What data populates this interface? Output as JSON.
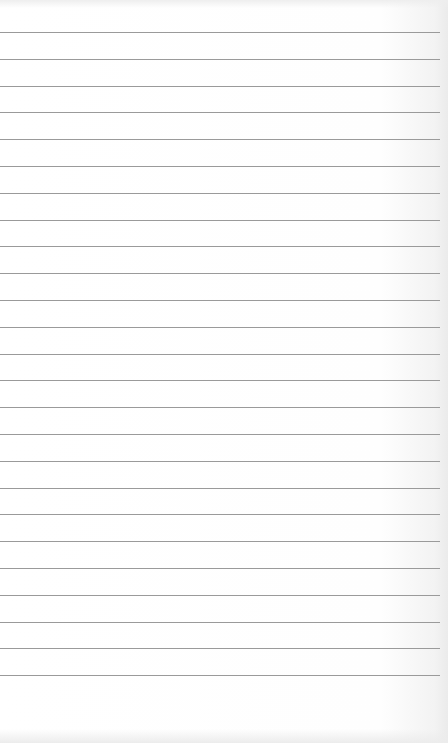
{
  "paper": {
    "type": "lined notepad sheet",
    "background_color": "#fdfdfd",
    "rule_color": "#9a9a9a",
    "rule_count": 25,
    "first_rule_y": 32,
    "rule_spacing": 26.8,
    "text": ""
  }
}
